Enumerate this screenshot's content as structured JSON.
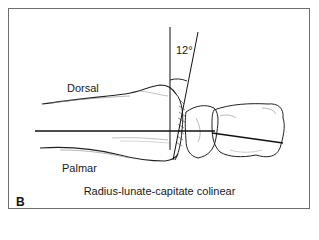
{
  "figure": {
    "panel_label": "B",
    "caption": "Radius-lunate-capitate colinear",
    "angle_label": "12°",
    "orientation_labels": {
      "dorsal": "Dorsal",
      "palmar": "Palmar"
    },
    "structures": [
      "radius",
      "lunate",
      "capitate"
    ],
    "colors": {
      "line": "#111111",
      "frame": "#6e6e6e",
      "background": "#ffffff"
    }
  }
}
